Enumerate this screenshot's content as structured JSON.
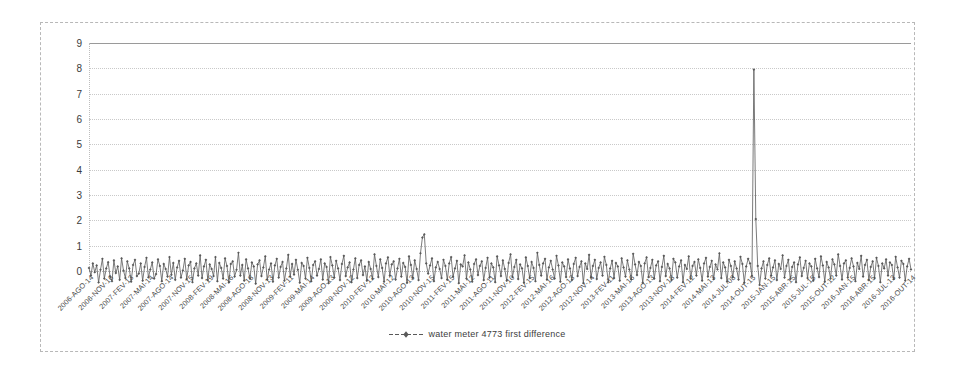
{
  "chart_data": {
    "type": "line",
    "title": "",
    "subtitle": "",
    "xlabel": "",
    "ylabel": "",
    "ylim": [
      0,
      9
    ],
    "yticks": [
      0,
      1,
      2,
      3,
      4,
      5,
      6,
      7,
      8,
      9
    ],
    "grid": true,
    "legend_position": "bottom-center",
    "series": [
      {
        "name": "water meter 4773 first difference",
        "marker": "diamond",
        "color": "#595959",
        "values": [
          0.12,
          -0.18,
          0.3,
          -0.05,
          0.22,
          -0.45,
          0.05,
          0.48,
          -0.3,
          0.1,
          0.35,
          -0.22,
          -0.4,
          0.42,
          -0.08,
          0.18,
          -0.35,
          0.5,
          0.02,
          -0.28,
          0.38,
          0.1,
          -0.42,
          0.24,
          0.44,
          -0.2,
          -0.1,
          0.3,
          -0.38,
          0.16,
          0.52,
          -0.25,
          0.06,
          0.34,
          -0.3,
          -0.12,
          0.46,
          0.2,
          -0.4,
          0.28,
          0.08,
          -0.22,
          0.55,
          -0.15,
          0.32,
          -0.35,
          0.14,
          0.4,
          -0.26,
          0.02,
          0.48,
          -0.32,
          0.22,
          0.36,
          -0.44,
          0.1,
          0.3,
          -0.18,
          0.62,
          -0.28,
          0.18,
          0.44,
          -0.36,
          0.26,
          0.08,
          -0.2,
          0.55,
          -0.4,
          0.32,
          0.12,
          -0.3,
          0.5,
          0.2,
          -0.45,
          0.28,
          0.38,
          -0.22,
          0.05,
          0.72,
          -0.18,
          0.24,
          -0.38,
          0.46,
          0.1,
          -0.3,
          0.34,
          0.18,
          -0.5,
          0.26,
          0.42,
          -0.2,
          0.14,
          0.58,
          -0.34,
          0.06,
          0.3,
          -0.42,
          0.22,
          0.48,
          -0.26,
          0.16,
          0.36,
          -0.38,
          0.1,
          0.64,
          -0.22,
          0.28,
          -0.14,
          0.44,
          0.05,
          -0.46,
          0.32,
          0.2,
          -0.3,
          0.52,
          0.12,
          -0.4,
          0.24,
          0.38,
          -0.18,
          0.08,
          0.46,
          -0.34,
          0.3,
          0.16,
          -0.48,
          0.55,
          0.22,
          -0.26,
          0.4,
          0.1,
          -0.36,
          0.28,
          0.6,
          -0.2,
          0.14,
          0.34,
          -0.44,
          0.06,
          0.5,
          -0.28,
          0.24,
          0.42,
          -0.16,
          0.18,
          -0.38,
          0.36,
          0.08,
          -0.3,
          0.66,
          0.2,
          -0.24,
          0.46,
          0.12,
          -0.42,
          0.3,
          0.54,
          -0.18,
          0.26,
          0.38,
          -0.34,
          0.1,
          0.48,
          -0.22,
          0.32,
          0.16,
          -0.46,
          0.58,
          0.24,
          -0.28,
          0.42,
          0.08,
          -0.36,
          0.7,
          1.32,
          1.45,
          0.3,
          -0.1,
          0.22,
          0.5,
          -0.4,
          0.14,
          0.36,
          0.08,
          -0.28,
          0.44,
          0.2,
          -0.34,
          0.3,
          0.55,
          -0.22,
          0.1,
          0.4,
          -0.48,
          0.26,
          0.18,
          0.62,
          -0.3,
          0.34,
          0.06,
          -0.42,
          0.28,
          0.46,
          -0.16,
          0.2,
          0.38,
          -0.36,
          0.12,
          0.52,
          -0.26,
          0.3,
          0.14,
          -0.44,
          0.58,
          0.22,
          -0.2,
          0.42,
          0.08,
          -0.38,
          0.32,
          0.66,
          -0.24,
          0.16,
          0.44,
          -0.32,
          0.26,
          0.1,
          -0.46,
          0.54,
          0.2,
          -0.28,
          0.36,
          0.12,
          -0.4,
          0.72,
          0.24,
          -0.18,
          0.3,
          0.48,
          -0.34,
          0.14,
          0.4,
          0.06,
          -0.3,
          0.6,
          0.22,
          -0.42,
          0.34,
          0.18,
          -0.24,
          0.46,
          0.1,
          -0.36,
          0.28,
          0.52,
          -0.2,
          0.16,
          0.38,
          -0.48,
          0.3,
          0.08,
          0.64,
          -0.26,
          0.2,
          0.44,
          -0.32,
          0.12,
          0.34,
          -0.18,
          0.56,
          0.24,
          -0.44,
          0.1,
          0.4,
          -0.28,
          0.32,
          0.18,
          -0.38,
          0.5,
          0.14,
          -0.22,
          0.42,
          0.06,
          -0.34,
          0.68,
          0.26,
          -0.16,
          0.36,
          0.2,
          -0.46,
          0.3,
          0.54,
          -0.24,
          0.12,
          0.44,
          -0.3,
          0.22,
          0.38,
          -0.4,
          0.16,
          0.6,
          -0.2,
          0.28,
          0.1,
          -0.36,
          0.48,
          0.34,
          -0.26,
          0.18,
          0.42,
          -0.44,
          0.24,
          0.08,
          0.58,
          -0.3,
          0.2,
          0.36,
          -0.18,
          0.46,
          0.12,
          -0.38,
          0.3,
          0.52,
          -0.22,
          0.16,
          0.4,
          -0.32,
          0.26,
          0.06,
          0.7,
          -0.28,
          0.34,
          0.14,
          -0.42,
          0.44,
          0.2,
          -0.24,
          0.38,
          0.1,
          -0.34,
          0.56,
          0.28,
          -0.46,
          0.18,
          0.48,
          0.3,
          -0.2,
          7.95,
          2.05,
          0.2,
          -0.55,
          0.1,
          0.38,
          -0.3,
          0.24,
          0.5,
          -0.18,
          0.14,
          0.42,
          -0.36,
          0.28,
          0.08,
          0.62,
          -0.26,
          0.2,
          0.44,
          -0.32,
          0.16,
          0.34,
          -0.44,
          0.26,
          0.54,
          -0.2,
          0.12,
          0.4,
          -0.28,
          0.3,
          0.18,
          -0.38,
          0.48,
          0.1,
          -0.24,
          0.58,
          0.22,
          -0.42,
          0.36,
          0.14,
          -0.3,
          0.46,
          0.26,
          -0.18,
          0.66,
          0.2,
          -0.34,
          0.3,
          0.42,
          -0.26,
          0.12,
          0.5,
          0.18,
          -0.4,
          0.32,
          0.08,
          0.6,
          -0.22,
          0.24,
          0.44,
          -0.36,
          0.16,
          0.38,
          -0.28,
          0.52,
          0.2,
          -0.44,
          0.3,
          0.1,
          0.46,
          -0.18,
          0.34,
          0.24,
          -0.32,
          0.56,
          0.14,
          -0.26,
          0.4,
          0.28,
          -0.38,
          0.18,
          0.48,
          0.06
        ]
      }
    ],
    "xticks": [
      "2006-AGO-14",
      "2006-NOV-16",
      "2007-FEV-13",
      "2007-MAI-14",
      "2007-AGO-14",
      "2007-NOV-15",
      "2008-FEV-19",
      "2008-MAI-16",
      "2008-AGO-18",
      "2008-NOV-13",
      "2009-FEV-11",
      "2009-MAI-14",
      "2009-AGO-13",
      "2009-NOV-12",
      "2010-FEV-12",
      "2010-MAI-12",
      "2010-AGO-13",
      "2010-NOV-15",
      "2011-FEV-15",
      "2011-MAI-12",
      "2011-AGO-11",
      "2011-NOV-10",
      "2012-FEV-15",
      "2012-MAI-16",
      "2012-AGO-13",
      "2012-NOV-14",
      "2013-FEV-11",
      "2013-MAI-16",
      "2013-AGO-13",
      "2013-NOV-18",
      "2014-FEV-12",
      "2014-MAI-13",
      "2014-JUL-08",
      "2014-OUT-15",
      "2015-JAN-15",
      "2015-ABR-15",
      "2015-JUL-15",
      "2015-OUT-12",
      "2016-JAN-15",
      "2016-ABR-15",
      "2016-JUL-13",
      "2016-OUT-14"
    ]
  },
  "legend": {
    "label": "water meter 4773 first difference",
    "symbol": "line-with-diamond-marker"
  }
}
